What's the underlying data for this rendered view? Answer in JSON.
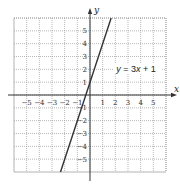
{
  "chart_data": {
    "type": "line",
    "title": "",
    "xlabel": "x",
    "ylabel": "y",
    "xlim": [
      -6,
      6
    ],
    "ylim": [
      -6,
      6
    ],
    "grid": true,
    "grid_style": "dotted",
    "x_ticks": [
      -5,
      -4,
      -3,
      -2,
      -1,
      1,
      2,
      3,
      4,
      5
    ],
    "y_ticks": [
      -5,
      -4,
      -3,
      -2,
      -1,
      1,
      2,
      3,
      4,
      5
    ],
    "x_tick_labels": [
      "−5",
      "−4",
      "−3",
      "−2",
      "−1",
      "1",
      "2",
      "3",
      "4",
      "5"
    ],
    "y_tick_labels": [
      "−5",
      "−4",
      "−3",
      "−2",
      "−1",
      "1",
      "2",
      "3",
      "4",
      "5"
    ],
    "series": [
      {
        "name": "y = 3x + 1",
        "equation": "y = 3x + 1",
        "slope": 3,
        "intercept": 1,
        "x": [
          -2.33,
          1.67
        ],
        "y": [
          -6,
          6
        ]
      }
    ],
    "annotations": [
      {
        "text": "y = 3x + 1",
        "x": 2.3,
        "y": 2
      }
    ]
  },
  "labels": {
    "x_axis": "x",
    "y_axis": "y",
    "equation": "y = 3x + 1"
  },
  "colors": {
    "line": "#333333",
    "axis": "#333333",
    "grid": "#9a9a9a",
    "background": "#ffffff"
  }
}
